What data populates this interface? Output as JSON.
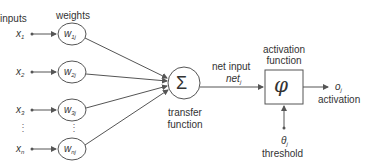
{
  "diagram": {
    "title_inputs": "inputs",
    "title_weights": "weights",
    "inputs": [
      {
        "symbol": "x",
        "sub": "1",
        "y": 34
      },
      {
        "symbol": "x",
        "sub": "2",
        "y": 72
      },
      {
        "symbol": "x",
        "sub": "3",
        "y": 110
      },
      {
        "symbol": "x",
        "sub": "n",
        "y": 149
      }
    ],
    "weights": [
      {
        "symbol": "w",
        "sub": "1j"
      },
      {
        "symbol": "w",
        "sub": "2j"
      },
      {
        "symbol": "w",
        "sub": "3j"
      },
      {
        "symbol": "w",
        "sub": "nj"
      }
    ],
    "ellipsis": "⋮",
    "sum_symbol": "Σ",
    "transfer_label_1": "transfer",
    "transfer_label_2": "function",
    "net_input_label": "net input",
    "net_symbol": "net",
    "net_sub": "j",
    "activation_title_1": "activation",
    "activation_title_2": "function",
    "phi_symbol": "φ",
    "output_symbol": "o",
    "output_sub": "j",
    "output_label": "activation",
    "threshold_symbol": "θ",
    "threshold_sub": "j",
    "threshold_label": "threshold",
    "colors": {
      "stroke": "#555555",
      "text": "#333333"
    }
  }
}
